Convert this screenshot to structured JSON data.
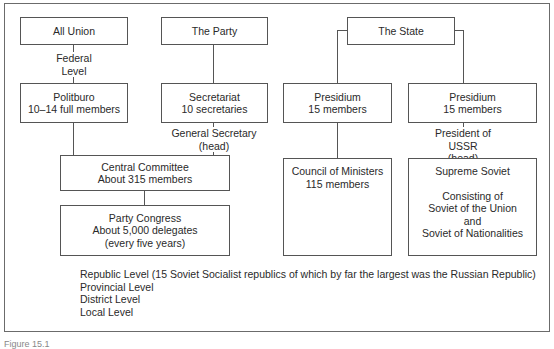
{
  "diagram": {
    "columns": {
      "all_union": {
        "title": "All Union",
        "level_label": [
          "Federal",
          "Level"
        ]
      },
      "party": {
        "title": "The Party"
      },
      "state": {
        "title": "The State"
      }
    },
    "boxes": {
      "politburo": [
        "Politburo",
        "10–14 full members"
      ],
      "secretariat": [
        "Secretariat",
        "10 secretaries"
      ],
      "presidium_left": [
        "Presidium",
        "15 members"
      ],
      "presidium_right": [
        "Presidium",
        "15 members"
      ],
      "central_committee": [
        "Central Committee",
        "About 315 members"
      ],
      "party_congress": [
        "Party Congress",
        "About 5,000 delegates",
        "(every five years)"
      ],
      "council_of_ministers": [
        "Council of Ministers",
        "115 members"
      ],
      "supreme_soviet": {
        "title": "Supreme Soviet",
        "details": [
          "Consisting of",
          "Soviet of the Union",
          "and",
          "Soviet of Nationalities"
        ]
      }
    },
    "connector_labels": {
      "general_secretary": [
        "General Secretary",
        "(head)"
      ],
      "president_ussr": [
        "President of USSR",
        "(head)"
      ]
    },
    "lower_levels": [
      "Republic Level (15 Soviet Socialist republics of which by far the largest was the Russian Republic)",
      "Provincial Level",
      "District Level",
      "Local Level"
    ],
    "caption": "Figure 15.1"
  }
}
